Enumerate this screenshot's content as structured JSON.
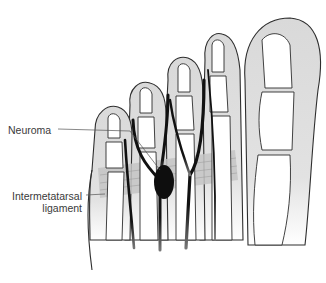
{
  "figure": {
    "labels": {
      "neuroma": "Neuroma",
      "ligament_line1": "Intermetatarsal",
      "ligament_line2": "ligament"
    },
    "colors": {
      "skin": "#d9d9d9",
      "bone": "#ffffff",
      "outline": "#2e2e2e",
      "nerve": "#111111",
      "ligament": "#c4c4c4",
      "label_text": "#3a3a3a"
    }
  }
}
